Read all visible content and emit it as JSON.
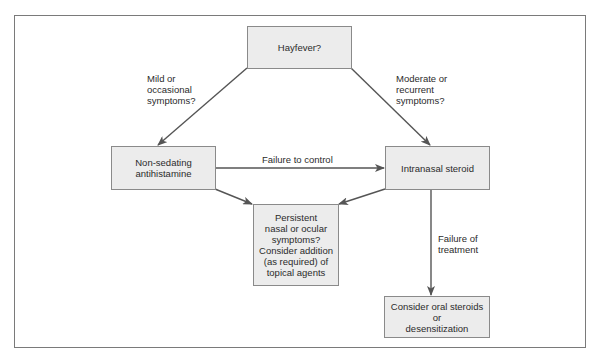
{
  "diagram": {
    "type": "flowchart",
    "colors": {
      "node_fill": "#ececec",
      "node_border": "#8a8a8a",
      "arrow": "#555555",
      "frame": "#7a7a7a"
    },
    "nodes": {
      "hayfever": {
        "lines": [
          "Hayfever?"
        ]
      },
      "antihistamine": {
        "lines": [
          "Non-sedating",
          "antihistamine"
        ]
      },
      "intranasal": {
        "lines": [
          "Intranasal steroid"
        ]
      },
      "persistent": {
        "lines": [
          "Persistent",
          "nasal or ocular",
          "symptoms?",
          "Consider addition",
          "(as required) of",
          "topical agents"
        ]
      },
      "oral": {
        "lines": [
          "Consider oral steroids",
          "or",
          "desensitization"
        ]
      }
    },
    "edge_labels": {
      "mild": {
        "lines": [
          "Mild or",
          "occasional",
          "symptoms?"
        ]
      },
      "moderate": {
        "lines": [
          "Moderate or",
          "recurrent",
          "symptoms?"
        ]
      },
      "failure_control": {
        "lines": [
          "Failure to control"
        ]
      },
      "failure_treatment": {
        "lines": [
          "Failure of",
          "treatment"
        ]
      }
    },
    "edges": [
      {
        "from": "hayfever",
        "to": "antihistamine",
        "label": "mild"
      },
      {
        "from": "hayfever",
        "to": "intranasal",
        "label": "moderate"
      },
      {
        "from": "antihistamine",
        "to": "intranasal",
        "label": "failure_control"
      },
      {
        "from": "antihistamine",
        "to": "persistent",
        "label": null
      },
      {
        "from": "intranasal",
        "to": "persistent",
        "label": null
      },
      {
        "from": "intranasal",
        "to": "oral",
        "label": "failure_treatment"
      }
    ]
  }
}
